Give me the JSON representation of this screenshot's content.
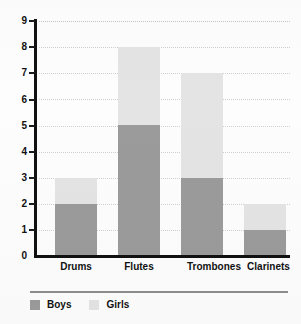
{
  "chart_data": {
    "type": "bar",
    "stacked": true,
    "title": "",
    "subtitle": "",
    "xlabel": "",
    "ylabel": "",
    "categories": [
      "Drums",
      "Flutes",
      "Trombones",
      "Clarinets"
    ],
    "series": [
      {
        "name": "Boys",
        "color": "#9b9b9b",
        "values": [
          2,
          5,
          3,
          1
        ]
      },
      {
        "name": "Girls",
        "color": "#e4e4e4",
        "values": [
          1,
          3,
          4,
          1
        ]
      }
    ],
    "totals": [
      3,
      8,
      7,
      2
    ],
    "ylim": [
      0,
      9
    ],
    "ytick_values": [
      0,
      1,
      2,
      3,
      4,
      5,
      6,
      7,
      8,
      9
    ],
    "ytick_labels": [
      "0",
      "1",
      "2",
      "3",
      "4",
      "5",
      "6",
      "7",
      "8",
      "9"
    ],
    "grid": true,
    "grid_style": "dotted",
    "grid_color": "#cfcfcf",
    "legend_position": "bottom-left",
    "axis_color": "#111111",
    "background": "#fdfdfd"
  },
  "legend": {
    "items": [
      {
        "label": "Boys",
        "color": "#9b9b9b"
      },
      {
        "label": "Girls",
        "color": "#e4e4e4"
      }
    ]
  }
}
